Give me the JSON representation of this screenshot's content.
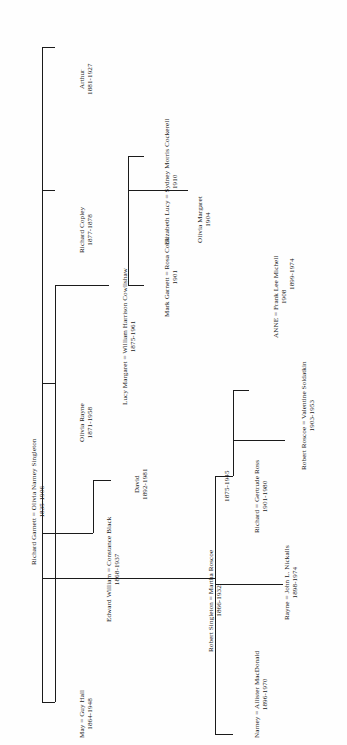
{
  "diagram": {
    "orientation": "rotated-90",
    "line_color": "#1b1b1b",
    "background": "#fefefe"
  },
  "people": {
    "root": {
      "name": "Richard Garnett = Olivia Narney Singleton",
      "dates": "1835-1906"
    },
    "may": {
      "name": "May = Guy Hall",
      "dates": "1864-1948"
    },
    "robert_singleton": {
      "name": "Robert Singleton = Martha Roscoe",
      "dates": "1866-1932",
      "dates2": "1875-1945"
    },
    "edward_william": {
      "name": "Edward William = Constance Black",
      "dates": "1868-1937"
    },
    "olivia_rayne": {
      "name": "Olivia Rayne",
      "dates": "1871-1958"
    },
    "richard_copley": {
      "name": "Richard Copley",
      "dates": "1877-1878"
    },
    "arthur": {
      "name": "Arthur",
      "dates": "1881-1927"
    },
    "david": {
      "name": "David",
      "dates": "1892-1981"
    },
    "lucy_margaret": {
      "name": "Lucy Margaret = William Harrison Cowlishaw",
      "dates": "1875-1961"
    },
    "mark_garnett": {
      "name": "Mark Garnett = Rosa Cook",
      "dates": "1901"
    },
    "elizabeth_lucy": {
      "name": "Elizabeth Lucy = Sydney Morris Cockerell",
      "dates": "1910"
    },
    "olivia_margaret": {
      "name": "Olivia Margaret",
      "dates": "1904"
    },
    "narney": {
      "name": "Narney = Allister MacDonald",
      "dates": "1896-1970"
    },
    "rayne": {
      "name": "Rayne = John L. Nickalls",
      "dates": "1898-1974"
    },
    "richard_gertrude": {
      "name": "Richard = Gertrude Ross",
      "dates": "1901-1980"
    },
    "anne": {
      "name": "ANNE = Frank Lee Michell",
      "dates": "1908",
      "dates2": "1899-1974"
    },
    "robert_roscoe": {
      "name": "Robert Roscoe = Valentine Soldatkin",
      "dates": "1903-1953"
    }
  }
}
